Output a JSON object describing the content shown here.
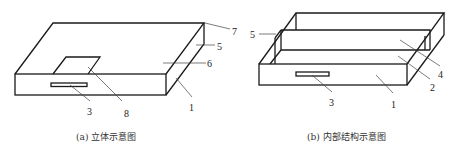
{
  "figures": [
    {
      "id": "a",
      "caption": "(a) 立体示意图",
      "labels": {
        "l1": "1",
        "l3": "3",
        "l5": "5",
        "l6": "6",
        "l7": "7",
        "l8": "8"
      }
    },
    {
      "id": "b",
      "caption": "(b) 内部结构示意图",
      "labels": {
        "l1": "1",
        "l2": "2",
        "l3": "3",
        "l4": "4",
        "l5": "5"
      }
    }
  ]
}
